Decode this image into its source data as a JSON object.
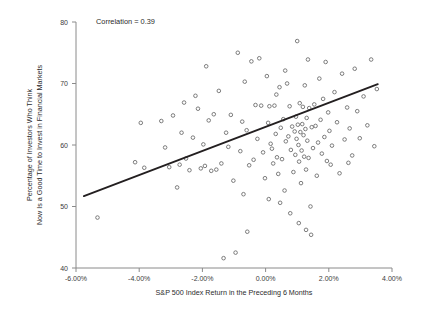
{
  "chart_data": {
    "type": "scatter",
    "title": "",
    "xlabel": "S&P 500 Index Return in the Preceding 6 Months",
    "ylabel": "Percentage of Investors Who Think Now Is a Good Time to Invest in Financial Markets",
    "ylabel_line1": "Percentage of Investors Who Think",
    "ylabel_line2": "Now Is a Good Time to Invest in Financial Markets",
    "annotation": "Correlation = 0.39",
    "correlation": 0.39,
    "grid": false,
    "legend": "none",
    "xlim": [
      -6.0,
      4.0
    ],
    "ylim": [
      40,
      80
    ],
    "xticks": [
      -6.0,
      -4.0,
      -2.0,
      0.0,
      2.0,
      4.0
    ],
    "xticklabels": [
      "-6.00%",
      "-4.00%",
      "-2.00%",
      "0.00%",
      "2.00%",
      "4.00%"
    ],
    "yticks": [
      40,
      50,
      60,
      70,
      80
    ],
    "yticklabels": [
      "40",
      "50",
      "60",
      "70",
      "80"
    ],
    "marker": "open-circle",
    "marker_color": "#6e6e6e",
    "line_color": "#231f20",
    "trend_line": {
      "x": [
        -5.75,
        3.55
      ],
      "y": [
        51.7,
        69.9
      ]
    },
    "points": [
      [
        -5.32,
        48.2
      ],
      [
        -4.13,
        57.2
      ],
      [
        -3.84,
        56.3
      ],
      [
        -3.3,
        63.9
      ],
      [
        -3.18,
        59.6
      ],
      [
        -3.05,
        56.4
      ],
      [
        -2.93,
        64.8
      ],
      [
        -2.8,
        53.1
      ],
      [
        -2.72,
        56.8
      ],
      [
        -2.58,
        66.9
      ],
      [
        -2.52,
        57.8
      ],
      [
        -2.41,
        55.9
      ],
      [
        -2.3,
        61.2
      ],
      [
        -2.22,
        68.0
      ],
      [
        -2.14,
        65.9
      ],
      [
        -2.05,
        56.2
      ],
      [
        -1.97,
        60.1
      ],
      [
        -1.88,
        72.8
      ],
      [
        -1.8,
        64.0
      ],
      [
        -1.72,
        55.8
      ],
      [
        -1.64,
        65.0
      ],
      [
        -1.56,
        56.0
      ],
      [
        -1.48,
        68.8
      ],
      [
        -1.4,
        57.0
      ],
      [
        -1.33,
        41.6
      ],
      [
        -1.25,
        62.0
      ],
      [
        -1.18,
        59.7
      ],
      [
        -1.1,
        64.9
      ],
      [
        -1.02,
        54.2
      ],
      [
        -0.95,
        42.5
      ],
      [
        -0.88,
        75.0
      ],
      [
        -0.8,
        59.0
      ],
      [
        -0.74,
        63.8
      ],
      [
        -0.66,
        70.3
      ],
      [
        -0.6,
        62.4
      ],
      [
        -0.52,
        56.7
      ],
      [
        -0.45,
        73.6
      ],
      [
        -0.38,
        57.6
      ],
      [
        -0.32,
        66.5
      ],
      [
        -0.26,
        61.0
      ],
      [
        -0.2,
        74.1
      ],
      [
        -0.14,
        66.4
      ],
      [
        -0.08,
        58.8
      ],
      [
        -0.02,
        54.6
      ],
      [
        0.04,
        71.2
      ],
      [
        0.08,
        63.6
      ],
      [
        0.12,
        66.3
      ],
      [
        0.16,
        60.2
      ],
      [
        0.2,
        59.4
      ],
      [
        0.24,
        57.0
      ],
      [
        0.28,
        66.4
      ],
      [
        0.32,
        61.8
      ],
      [
        0.36,
        58.0
      ],
      [
        0.4,
        55.3
      ],
      [
        0.44,
        69.4
      ],
      [
        0.48,
        62.8
      ],
      [
        0.52,
        57.7
      ],
      [
        0.56,
        64.2
      ],
      [
        0.6,
        52.6
      ],
      [
        0.64,
        60.6
      ],
      [
        0.68,
        70.0
      ],
      [
        0.72,
        61.4
      ],
      [
        0.76,
        66.3
      ],
      [
        0.8,
        59.2
      ],
      [
        0.84,
        63.0
      ],
      [
        0.88,
        55.6
      ],
      [
        0.92,
        62.2
      ],
      [
        0.94,
        58.4
      ],
      [
        0.96,
        64.6
      ],
      [
        0.98,
        61.0
      ],
      [
        1.0,
        76.9
      ],
      [
        1.02,
        63.3
      ],
      [
        1.04,
        60.0
      ],
      [
        1.06,
        57.3
      ],
      [
        1.08,
        66.8
      ],
      [
        1.1,
        62.1
      ],
      [
        1.12,
        53.8
      ],
      [
        1.14,
        59.1
      ],
      [
        1.16,
        63.4
      ],
      [
        1.18,
        66.2
      ],
      [
        1.2,
        61.6
      ],
      [
        1.22,
        58.1
      ],
      [
        1.24,
        69.7
      ],
      [
        1.26,
        62.6
      ],
      [
        1.28,
        56.0
      ],
      [
        1.3,
        64.4
      ],
      [
        1.32,
        60.7
      ],
      [
        1.34,
        73.9
      ],
      [
        1.36,
        57.9
      ],
      [
        1.38,
        66.0
      ],
      [
        1.42,
        50.0
      ],
      [
        1.46,
        62.9
      ],
      [
        1.5,
        59.5
      ],
      [
        1.54,
        66.6
      ],
      [
        1.58,
        63.1
      ],
      [
        1.62,
        55.0
      ],
      [
        1.66,
        60.4
      ],
      [
        1.7,
        70.8
      ],
      [
        1.74,
        64.1
      ],
      [
        1.78,
        58.6
      ],
      [
        1.82,
        67.5
      ],
      [
        1.86,
        61.3
      ],
      [
        1.9,
        73.5
      ],
      [
        1.94,
        57.4
      ],
      [
        1.98,
        65.3
      ],
      [
        2.02,
        62.3
      ],
      [
        2.1,
        59.9
      ],
      [
        2.18,
        68.6
      ],
      [
        2.26,
        63.7
      ],
      [
        2.34,
        55.4
      ],
      [
        2.42,
        71.6
      ],
      [
        2.5,
        60.9
      ],
      [
        2.58,
        66.1
      ],
      [
        2.66,
        62.7
      ],
      [
        2.74,
        58.3
      ],
      [
        2.82,
        72.4
      ],
      [
        2.9,
        65.5
      ],
      [
        2.98,
        61.1
      ],
      [
        3.1,
        67.9
      ],
      [
        3.22,
        63.2
      ],
      [
        3.34,
        73.9
      ],
      [
        3.44,
        59.8
      ],
      [
        3.52,
        69.1
      ],
      [
        -3.95,
        63.6
      ],
      [
        -2.66,
        62.0
      ],
      [
        -1.92,
        56.6
      ],
      [
        -0.7,
        52.0
      ],
      [
        0.1,
        51.2
      ],
      [
        0.46,
        50.6
      ],
      [
        0.78,
        48.9
      ],
      [
        1.05,
        47.3
      ],
      [
        1.28,
        46.2
      ],
      [
        0.34,
        68.2
      ],
      [
        0.62,
        72.1
      ],
      [
        1.44,
        45.4
      ],
      [
        -0.58,
        45.9
      ],
      [
        2.06,
        56.8
      ],
      [
        2.62,
        57.1
      ]
    ]
  }
}
